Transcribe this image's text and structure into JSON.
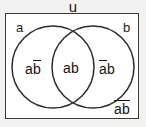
{
  "figure": {
    "type": "venn-diagram",
    "universe_label": "u",
    "sets": {
      "left_name": "a",
      "right_name": "b"
    },
    "regions": [
      {
        "id": "left-only",
        "expression": "ab̅",
        "plain": "a NOT b",
        "parts": [
          {
            "text": "a",
            "overbar": false
          },
          {
            "text": "b",
            "overbar": true
          }
        ]
      },
      {
        "id": "intersection",
        "expression": "ab",
        "plain": "a AND b",
        "parts": [
          {
            "text": "ab",
            "overbar": false
          }
        ]
      },
      {
        "id": "right-only",
        "expression": "a̅b",
        "plain": "NOT a AND b",
        "parts": [
          {
            "text": "a",
            "overbar": true
          },
          {
            "text": "b",
            "overbar": false
          }
        ]
      },
      {
        "id": "outside",
        "expression": "a̅b̅",
        "plain": "NOT a AND NOT b",
        "parts": [
          {
            "text": "ab",
            "overbar": true
          }
        ]
      }
    ],
    "geometry": {
      "box": {
        "x": 5,
        "y": 13,
        "width": 134,
        "height": 106
      },
      "left_circle": {
        "cx": 48,
        "cy": 54,
        "r": 41
      },
      "right_circle": {
        "cx": 88,
        "cy": 54,
        "r": 41
      }
    },
    "colors": {
      "stroke": "#2b2b2b",
      "box_border": "#3a3a3a",
      "text": "#111111",
      "page_background": "#f2f2f0",
      "box_fill": "#ffffff"
    }
  }
}
